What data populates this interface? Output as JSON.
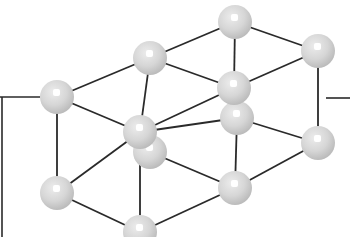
{
  "diagram": {
    "type": "crystal-lattice-ball-and-stick",
    "background": "#ffffff",
    "bond_color": "#2a2a2a",
    "atom_fill": "#d9d9d9",
    "atom_shade": "#bdbdbd",
    "atom_highlight": "#ffffff",
    "atom_radius": 17,
    "atoms": [
      {
        "id": "B",
        "x": 235,
        "y": 22
      },
      {
        "id": "C",
        "x": 318,
        "y": 51
      },
      {
        "id": "A",
        "x": 150,
        "y": 58
      },
      {
        "id": "D",
        "x": 57,
        "y": 97
      },
      {
        "id": "H",
        "x": 237,
        "y": 118
      },
      {
        "id": "E",
        "x": 234,
        "y": 88
      },
      {
        "id": "K",
        "x": 318,
        "y": 143
      },
      {
        "id": "G",
        "x": 150,
        "y": 152
      },
      {
        "id": "F",
        "x": 140,
        "y": 132
      },
      {
        "id": "I",
        "x": 57,
        "y": 193
      },
      {
        "id": "J",
        "x": 235,
        "y": 188
      },
      {
        "id": "L",
        "x": 140,
        "y": 232
      }
    ],
    "bonds": [
      [
        "D",
        "A"
      ],
      [
        "A",
        "B"
      ],
      [
        "B",
        "C"
      ],
      [
        "A",
        "E"
      ],
      [
        "E",
        "C"
      ],
      [
        "B",
        "E"
      ],
      [
        "D",
        "F"
      ],
      [
        "F",
        "E"
      ],
      [
        "D",
        "I"
      ],
      [
        "C",
        "K"
      ],
      [
        "E",
        "H"
      ],
      [
        "H",
        "J"
      ],
      [
        "F",
        "L"
      ],
      [
        "I",
        "F"
      ],
      [
        "I",
        "L"
      ],
      [
        "F",
        "H"
      ],
      [
        "G",
        "J"
      ],
      [
        "J",
        "K"
      ],
      [
        "H",
        "K"
      ],
      [
        "L",
        "J"
      ],
      [
        "A",
        "F"
      ]
    ],
    "stub_lines": [
      {
        "x1": 0,
        "y1": 97,
        "x2": 40,
        "y2": 97
      },
      {
        "x1": 2,
        "y1": 97,
        "x2": 2,
        "y2": 237
      },
      {
        "x1": 326,
        "y1": 98,
        "x2": 350,
        "y2": 98
      }
    ]
  }
}
